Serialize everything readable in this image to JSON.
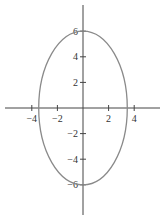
{
  "chart_data": {
    "type": "line",
    "title": "",
    "xlabel": "",
    "ylabel": "",
    "curve": {
      "kind": "ellipse",
      "equation": "x^2/12 + y^2/36 = 1",
      "center": [
        0,
        0
      ],
      "semi_axis_x": 3.46,
      "semi_axis_y": 6,
      "color": "#8a8a8a"
    },
    "x_ticks": [
      -4,
      -2,
      2,
      4
    ],
    "y_ticks": [
      6,
      4,
      2,
      -2,
      -4,
      -6
    ],
    "x_tick_labels": [
      "−4",
      "−2",
      "2",
      "4"
    ],
    "y_tick_labels": [
      "6",
      "4",
      "2",
      "−2",
      "−4",
      "−6"
    ],
    "xlim": [
      -6,
      6
    ],
    "ylim": [
      -8,
      8
    ],
    "grid": false,
    "legend": null,
    "axis_color": "#444444"
  }
}
